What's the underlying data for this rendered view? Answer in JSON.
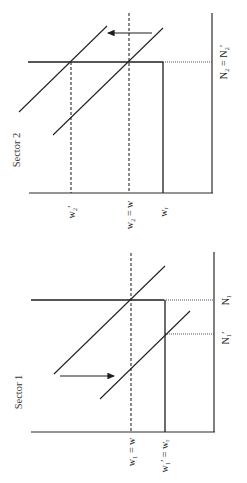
{
  "figure": {
    "orientation": "rotated 90 degrees (text reads bottom-to-top)",
    "panels": [
      {
        "id": "sector2",
        "title": "Sector 2",
        "labels": {
          "wage_new": "w₂′",
          "wage_eq": "w₂ = w",
          "wage_reservation": "wᵣ",
          "employment": "N₂ = N₂′"
        },
        "arrow_direction": "left"
      },
      {
        "id": "sector1",
        "title": "Sector 1",
        "labels": {
          "wage_eq": "w₁ = w",
          "wage_new": "w₁′ = wᵣ",
          "employment": "N₁",
          "employment_new": "N₁′"
        },
        "arrow_direction": "right"
      }
    ]
  }
}
